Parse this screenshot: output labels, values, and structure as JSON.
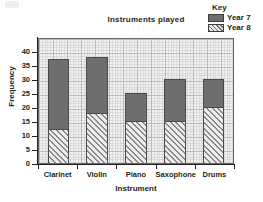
{
  "chart_data": {
    "type": "bar",
    "subtype": "stacked",
    "title": "Instruments played",
    "xlabel": "Instrument",
    "ylabel": "Frequency",
    "categories": [
      "Clarinet",
      "Violin",
      "Piano",
      "Saxophone",
      "Drums"
    ],
    "series": [
      {
        "name": "Year 8",
        "values": [
          12,
          18,
          15,
          15,
          20
        ],
        "color": "#ececec",
        "pattern": "diagonal-hatch"
      },
      {
        "name": "Year 7",
        "values": [
          25,
          20,
          10,
          15,
          10
        ],
        "color": "#6e6e6e",
        "pattern": "solid"
      }
    ],
    "stack_totals": [
      37,
      38,
      25,
      30,
      30
    ],
    "ylim": [
      0,
      45
    ],
    "ytick_labels": [
      "0",
      "5",
      "10",
      "15",
      "20",
      "25",
      "30",
      "35",
      "40"
    ],
    "ytick_values": [
      0,
      5,
      10,
      15,
      20,
      25,
      30,
      35,
      40
    ],
    "grid": true,
    "grid_minor_step": 1,
    "grid_major_step": 5,
    "legend_position": "top-right"
  },
  "legend": {
    "title": "Key",
    "entries": [
      {
        "label": "Year 7",
        "swatch": "solid-dark-gray"
      },
      {
        "label": "Year 8",
        "swatch": "diagonal-hatch"
      }
    ]
  }
}
